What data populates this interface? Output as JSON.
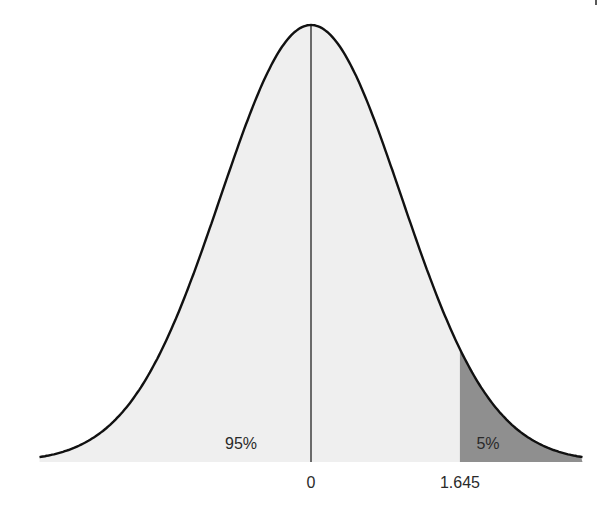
{
  "chart_data": {
    "type": "area",
    "title": "",
    "xlabel": "",
    "ylabel": "",
    "distribution": "standard normal",
    "x_range": [
      -3,
      3
    ],
    "tick_labels": [
      "0",
      "1.645"
    ],
    "tick_values": [
      0,
      1.645
    ],
    "critical_value": 1.645,
    "regions": [
      {
        "name": "acceptance",
        "from": -3,
        "to": 1.645,
        "label": "95%",
        "area": 0.95,
        "color": "#efefef"
      },
      {
        "name": "rejection",
        "from": 1.645,
        "to": 3,
        "label": "5%",
        "area": 0.05,
        "color": "#8f8f8f"
      }
    ],
    "mean_line": 0,
    "grid": false,
    "legend": "none"
  },
  "labels": {
    "left_area": "95%",
    "right_area": "5%",
    "tick_zero": "0",
    "tick_critical": "1.645"
  },
  "colors": {
    "curve": "#111111",
    "light_fill": "#efefef",
    "dark_fill": "#8f8f8f",
    "text": "#2a2a2a"
  }
}
